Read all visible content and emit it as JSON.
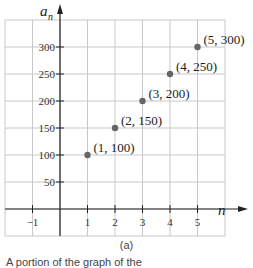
{
  "chart_data": {
    "type": "scatter",
    "title": "",
    "xlabel": "n",
    "ylabel": "a_n",
    "ylabel_main": "a",
    "ylabel_sub": "n",
    "x": [
      1,
      2,
      3,
      4,
      5
    ],
    "values": [
      100,
      150,
      200,
      250,
      300
    ],
    "point_labels": [
      "(1, 100)",
      "(2, 150)",
      "(3, 200)",
      "(4, 250)",
      "(5, 300)"
    ],
    "xticks": [
      "−1",
      "1",
      "2",
      "3",
      "4",
      "5"
    ],
    "yticks": [
      "50",
      "100",
      "150",
      "200",
      "250",
      "300"
    ],
    "xlim": [
      -2,
      6
    ],
    "ylim": [
      -50,
      350
    ],
    "grid": true,
    "point_color": "#666666",
    "grid_color": "#c8c8c8",
    "axis_color": "#222222"
  },
  "caption": {
    "label": "(a)",
    "text": "A portion of the graph of the"
  }
}
